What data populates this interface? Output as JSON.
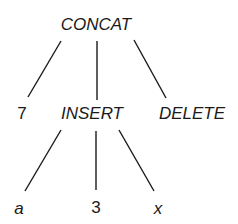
{
  "diagram": {
    "type": "tree",
    "root": {
      "label": "CONCAT",
      "children": [
        {
          "label": "7"
        },
        {
          "label": "INSERT",
          "children": [
            {
              "label": "a"
            },
            {
              "label": "3"
            },
            {
              "label": "x"
            }
          ]
        },
        {
          "label": "DELETE"
        }
      ]
    },
    "colors": {
      "line": "#1a1a1a",
      "text": "#1a1a1a",
      "background": "#ffffff"
    }
  }
}
